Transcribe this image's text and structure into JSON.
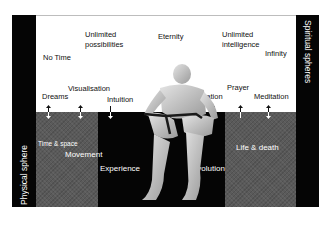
{
  "diagram": {
    "side_labels": {
      "left": "Physical sphere",
      "right": "Spiritual spheres"
    },
    "spiritual_terms": [
      {
        "label": "No Time",
        "x": 43,
        "y": 53
      },
      {
        "label": "Unlimited",
        "x": 85,
        "y": 30
      },
      {
        "label": "possibilities",
        "x": 85,
        "y": 40
      },
      {
        "label": "Eternity",
        "x": 158,
        "y": 32
      },
      {
        "label": "Unlimited",
        "x": 222,
        "y": 30
      },
      {
        "label": "intelligence",
        "x": 222,
        "y": 40
      },
      {
        "label": "Infinity",
        "x": 265,
        "y": 49
      },
      {
        "label": "Dreams",
        "x": 42,
        "y": 92
      },
      {
        "label": "Visualisation",
        "x": 68,
        "y": 84
      },
      {
        "label": "Intuition",
        "x": 107,
        "y": 95
      },
      {
        "label": "Inspiration",
        "x": 188,
        "y": 92
      },
      {
        "label": "Prayer",
        "x": 227,
        "y": 83
      },
      {
        "label": "Meditation",
        "x": 254,
        "y": 92
      }
    ],
    "physical_terms": [
      {
        "label": "Time & space",
        "x": 38,
        "y": 139,
        "size": 6.5
      },
      {
        "label": "Movement",
        "x": 65,
        "y": 150,
        "size": 8
      },
      {
        "label": "Experience",
        "x": 100,
        "y": 164,
        "size": 8
      },
      {
        "label": "Evolution",
        "x": 192,
        "y": 164,
        "size": 8
      },
      {
        "label": "Life & death",
        "x": 236,
        "y": 143,
        "size": 8
      }
    ],
    "arrows": [
      {
        "x": 48,
        "type": "bidirectional"
      },
      {
        "x": 80,
        "type": "bidirectional"
      },
      {
        "x": 110,
        "type": "down"
      },
      {
        "x": 214,
        "type": "down"
      },
      {
        "x": 240,
        "type": "up"
      },
      {
        "x": 268,
        "type": "bidirectional"
      }
    ],
    "central_image": "seated-human-figure",
    "colors": {
      "background": "#ffffff",
      "band": "#050505",
      "texture_panel": "#5a5a5a",
      "text_dark": "#111111",
      "text_light": "#ffffff"
    }
  }
}
